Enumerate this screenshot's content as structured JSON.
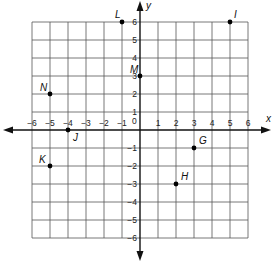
{
  "chart_data": {
    "type": "scatter",
    "title": "",
    "xlabel": "x",
    "ylabel": "y",
    "xlim": [
      -6,
      6
    ],
    "ylim": [
      -6,
      6
    ],
    "grid": true,
    "x_ticks": [
      "-6",
      "-5",
      "-4",
      "-3",
      "-2",
      "-1",
      "1",
      "2",
      "3",
      "4",
      "5",
      "6"
    ],
    "y_ticks": [
      "6",
      "5",
      "4",
      "3",
      "2",
      "1",
      "-1",
      "-2",
      "-3",
      "-4",
      "-5",
      "-6"
    ],
    "origin_label": "0",
    "points": [
      {
        "label": "L",
        "x": -1,
        "y": 6
      },
      {
        "label": "I",
        "x": 5,
        "y": 6
      },
      {
        "label": "N",
        "x": -5,
        "y": 2
      },
      {
        "label": "M",
        "x": 0,
        "y": 3
      },
      {
        "label": "J",
        "x": -4,
        "y": 0
      },
      {
        "label": "K",
        "x": -5,
        "y": -2
      },
      {
        "label": "G",
        "x": 3,
        "y": -1
      },
      {
        "label": "H",
        "x": 2,
        "y": -3
      }
    ]
  },
  "colors": {
    "grid": "#555555",
    "axis": "#111111",
    "point": "#000000",
    "background": "#ffffff"
  }
}
